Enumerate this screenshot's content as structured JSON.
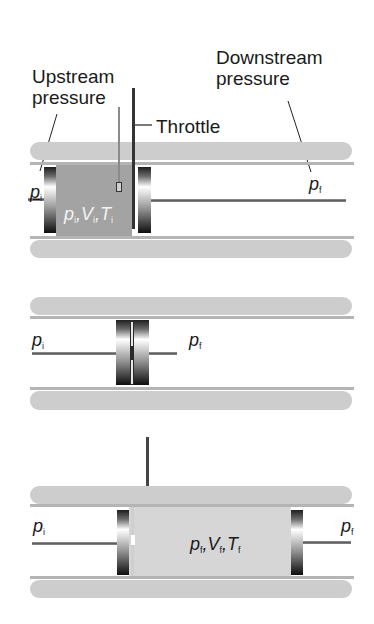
{
  "figure": {
    "labels": {
      "upstream": [
        "Upstream",
        "pressure"
      ],
      "downstream": [
        "Downstream",
        "pressure"
      ],
      "throttle": "Throttle"
    },
    "top": {
      "p_left": {
        "var": "p",
        "sub": "i"
      },
      "p_right": {
        "var": "p",
        "sub": "f"
      },
      "state": {
        "p": "p",
        "p_sub": "i",
        "V": "V",
        "V_sub": "i",
        "T": "T",
        "T_sub": "i"
      }
    },
    "middle": {
      "p_left": {
        "var": "p",
        "sub": "i"
      },
      "p_right": {
        "var": "p",
        "sub": "f"
      }
    },
    "bottom": {
      "p_left": {
        "var": "p",
        "sub": "i"
      },
      "p_right": {
        "var": "p",
        "sub": "f"
      },
      "state": {
        "p": "p",
        "p_sub": "f",
        "V": "V",
        "V_sub": "f",
        "T": "T",
        "T_sub": "f"
      }
    },
    "colors": {
      "wall": "#cdcdcd",
      "gas_initial": "#a3a3a3",
      "gas_final": "#d6d6d6",
      "piston_dark": "#1e1e1e"
    }
  }
}
